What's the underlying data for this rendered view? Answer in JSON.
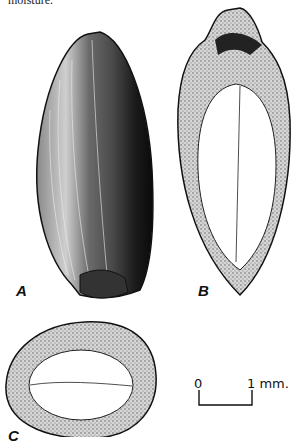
{
  "caption_fragment": "moisture.",
  "figures": [
    {
      "id": "A",
      "label": "A",
      "description": "external view of seed"
    },
    {
      "id": "B",
      "label": "B",
      "description": "longitudinal section"
    },
    {
      "id": "C",
      "label": "C",
      "description": "cross section"
    }
  ],
  "scale_bar": {
    "start_label": "0",
    "end_label": "1 mm."
  },
  "colors": {
    "ink": "#111111",
    "paper": "#ffffff",
    "stipple": "#9a9a9a"
  }
}
